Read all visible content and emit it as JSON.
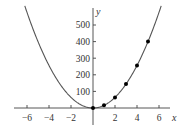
{
  "chart_data": {
    "type": "line",
    "title": "",
    "xlabel": "x",
    "ylabel": "y",
    "function": "y = 16x^2",
    "xlim": [
      -7,
      7.5
    ],
    "ylim": [
      -100,
      600
    ],
    "grid": false,
    "legend": null,
    "x_ticks": [
      -6,
      -4,
      -2,
      2,
      4,
      6
    ],
    "x_tick_labels": [
      "−6",
      "−4",
      "−2",
      "2",
      "4",
      "6"
    ],
    "y_ticks": [
      100,
      200,
      300,
      400,
      500
    ],
    "y_tick_labels": [
      "100",
      "200",
      "300",
      "400",
      "500"
    ],
    "series": [
      {
        "name": "curve",
        "kind": "line",
        "x_range": [
          -6.2,
          6.2
        ],
        "color": "#555555"
      },
      {
        "name": "data points",
        "kind": "scatter",
        "x": [
          0,
          1,
          2,
          3,
          4,
          5
        ],
        "y": [
          0,
          16,
          64,
          144,
          256,
          400
        ],
        "color": "#000000"
      }
    ]
  },
  "colors": {
    "axis": "#444444",
    "curve": "#555555",
    "points": "#000000",
    "background": "#ffffff"
  }
}
